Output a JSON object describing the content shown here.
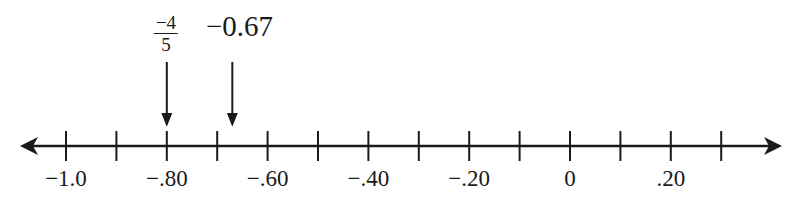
{
  "diagram": {
    "type": "number_line",
    "axis": {
      "min": -1.0,
      "max": 0.3,
      "step": 0.1,
      "arrows": "both"
    },
    "tick_labels": [
      {
        "value": -1.0,
        "text": "−1.0"
      },
      {
        "value": -0.8,
        "text": "−.80"
      },
      {
        "value": -0.6,
        "text": "−.60"
      },
      {
        "value": -0.4,
        "text": "−.40"
      },
      {
        "value": -0.2,
        "text": "−.20"
      },
      {
        "value": 0.0,
        "text": "0"
      },
      {
        "value": 0.2,
        "text": ".20"
      }
    ],
    "markers": [
      {
        "value": -0.8,
        "label_numerator": "−4",
        "label_denominator": "5",
        "label_type": "fraction"
      },
      {
        "value": -0.67,
        "label": "−0.67",
        "label_type": "decimal"
      }
    ]
  },
  "colors": {
    "ink": "#1a1a1a",
    "background": "#ffffff"
  }
}
